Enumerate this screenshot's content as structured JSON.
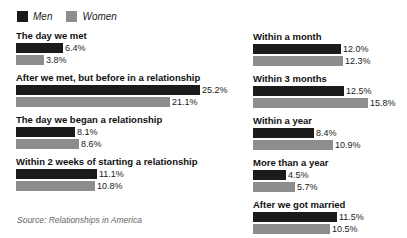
{
  "legend": {
    "items": [
      {
        "label": "Men",
        "color": "#1b1b1b"
      },
      {
        "label": "Women",
        "color": "#8d8d8d"
      }
    ]
  },
  "source_note": "Source: Relationships in America",
  "colors": {
    "men": "#1b1b1b",
    "women": "#8d8d8d",
    "background": "#ffffff",
    "label_text": "#111111",
    "value_text": "#1a1a1a",
    "source_text": "#666666"
  },
  "chart_data": {
    "type": "bar",
    "orientation": "horizontal",
    "unit": "%",
    "title": "",
    "legend": [
      "Men",
      "Women"
    ],
    "legend_position": "top-left",
    "xlim": [
      0,
      26
    ],
    "grid": false,
    "categories": [
      "The day we met",
      "After we met, but before in a relationship",
      "The day we began a relationship",
      "Within 2 weeks of starting a relationship",
      "Within a month",
      "Within 3 months",
      "Within a year",
      "More than a year",
      "After we got married"
    ],
    "series": [
      {
        "name": "Men",
        "values": [
          6.4,
          25.2,
          8.1,
          11.1,
          12.0,
          12.5,
          8.4,
          4.5,
          11.5
        ]
      },
      {
        "name": "Women",
        "values": [
          3.8,
          21.1,
          8.6,
          10.8,
          12.3,
          15.8,
          10.9,
          5.7,
          10.5
        ]
      }
    ],
    "column_layout": [
      [
        0,
        1,
        2,
        3
      ],
      [
        4,
        5,
        6,
        7,
        8
      ]
    ],
    "source": "Source: Relationships in America"
  }
}
